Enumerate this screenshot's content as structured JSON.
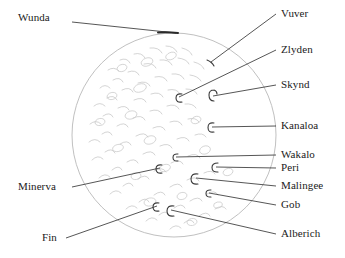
{
  "figure": {
    "type": "annotated-moon-map",
    "body_shape": "circle",
    "background_color": "#ffffff",
    "outline_color": "#b9b9b9",
    "leader_line_color": "#2b2b2b",
    "text_color": "#1a1a1a",
    "disk": {
      "center_x": 174,
      "center_y": 135,
      "radius": 102
    }
  },
  "labels": [
    {
      "id": "wunda",
      "name": "Wunda",
      "side": "left",
      "text_x": 18,
      "text_y": 18,
      "leader": [
        [
          72,
          22
        ],
        [
          176,
          33
        ]
      ]
    },
    {
      "id": "vuver",
      "name": "Vuver",
      "side": "right",
      "text_x": 281,
      "text_y": 10,
      "leader": [
        [
          276,
          14
        ],
        [
          211,
          62
        ]
      ]
    },
    {
      "id": "zlyden",
      "name": "Zlyden",
      "side": "right",
      "text_x": 281,
      "text_y": 45,
      "leader": [
        [
          276,
          50
        ],
        [
          179,
          97
        ]
      ]
    },
    {
      "id": "skynd",
      "name": "Skynd",
      "side": "right",
      "text_x": 281,
      "text_y": 80,
      "leader": [
        [
          276,
          85
        ],
        [
          213,
          96
        ]
      ]
    },
    {
      "id": "kanaloa",
      "name": "Kanaloa",
      "side": "right",
      "text_x": 281,
      "text_y": 121,
      "leader": [
        [
          276,
          126
        ],
        [
          212,
          127
        ]
      ]
    },
    {
      "id": "wakalo",
      "name": "Wakalo",
      "side": "right",
      "text_x": 281,
      "text_y": 150,
      "leader": [
        [
          276,
          155
        ],
        [
          176,
          157
        ]
      ]
    },
    {
      "id": "peri",
      "name": "Peri",
      "side": "right",
      "text_x": 281,
      "text_y": 163,
      "leader": [
        [
          276,
          168
        ],
        [
          216,
          167
        ]
      ]
    },
    {
      "id": "malingee",
      "name": "Malingee",
      "side": "right",
      "text_x": 281,
      "text_y": 181,
      "leader": [
        [
          276,
          186
        ],
        [
          196,
          178
        ]
      ]
    },
    {
      "id": "gob",
      "name": "Gob",
      "side": "right",
      "text_x": 281,
      "text_y": 200,
      "leader": [
        [
          276,
          205
        ],
        [
          209,
          193
        ]
      ]
    },
    {
      "id": "alberich",
      "name": "Alberich",
      "side": "right",
      "text_x": 281,
      "text_y": 229,
      "leader": [
        [
          276,
          234
        ],
        [
          171,
          210
        ]
      ]
    },
    {
      "id": "minerva",
      "name": "Minerva",
      "side": "left",
      "text_x": 18,
      "text_y": 182,
      "leader": [
        [
          72,
          187
        ],
        [
          160,
          168
        ]
      ]
    },
    {
      "id": "fin",
      "name": "Fin",
      "side": "left",
      "text_x": 42,
      "text_y": 233,
      "leader": [
        [
          66,
          238
        ],
        [
          157,
          206
        ]
      ]
    }
  ]
}
